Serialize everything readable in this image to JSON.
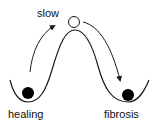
{
  "diagram": {
    "labels": {
      "top": "slow",
      "left_state": "healing",
      "right_state": "fibrosis"
    },
    "colors": {
      "line": "#1a1a1a",
      "ball_filled": "#000000",
      "ball_open_fill": "#ffffff",
      "background": "#ffffff"
    },
    "elements": {
      "landscape": "double-well energy curve",
      "left_ball": "filled ball in left well",
      "right_ball": "filled ball in right well",
      "top_ball": "open ball at barrier peak",
      "left_arrow": "arrow up from left well toward peak",
      "right_arrow": "arrow down from peak into right well"
    }
  }
}
